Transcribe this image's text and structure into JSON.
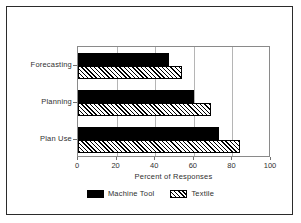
{
  "chart_data": {
    "type": "bar",
    "orientation": "horizontal",
    "title": "",
    "xlabel": "Percent of Responses",
    "ylabel": "",
    "categories": [
      "Forecasting",
      "Planning",
      "Plan Use"
    ],
    "series": [
      {
        "name": "Machine Tool",
        "values": [
          47,
          60,
          73
        ],
        "fill": "solid",
        "color": "#000000"
      },
      {
        "name": "Textile",
        "values": [
          54,
          69,
          84
        ],
        "fill": "hatch",
        "color": "#000000"
      }
    ],
    "xlim": [
      0,
      100
    ],
    "xticks": [
      0,
      20,
      40,
      60,
      80,
      100
    ],
    "xtick_labels": [
      "0",
      "20",
      "40",
      "60",
      "80",
      "100"
    ],
    "grid": "vertical",
    "legend_position": "bottom",
    "frame_color": "#2b2b2b",
    "axis_color": "#8a8a8a",
    "gridline_color": "#b5b5b5"
  }
}
